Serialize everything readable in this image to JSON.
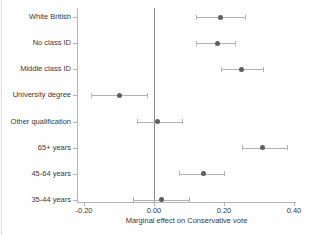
{
  "chart_data": {
    "type": "scatter",
    "subtype": "coefficient-forest-plot",
    "title": "",
    "xlabel": "Marginal effect on Conservative vote",
    "ylabel": "",
    "categories": [
      "White British",
      "No class ID",
      "Middle class ID",
      "University degree",
      "Other qualification",
      "65+ years",
      "45-64 years",
      "35-44 years"
    ],
    "series": [
      {
        "name": "Marginal effect (point estimate with 95% CI)",
        "values": [
          0.19,
          0.18,
          0.25,
          -0.1,
          0.01,
          0.31,
          0.14,
          0.02
        ],
        "ci_low": [
          0.12,
          0.12,
          0.19,
          -0.18,
          -0.05,
          0.25,
          0.07,
          -0.06
        ],
        "ci_high": [
          0.26,
          0.23,
          0.31,
          -0.02,
          0.08,
          0.38,
          0.2,
          0.1
        ]
      }
    ],
    "xlim": [
      -0.22,
      0.41
    ],
    "x_ticks": [
      -0.2,
      0.0,
      0.2,
      0.4
    ],
    "x_tick_labels": [
      "-0.20",
      "0.00",
      "0.20",
      "0.40"
    ],
    "reference_line_x": 0,
    "grid": false,
    "legend": "none",
    "style": {
      "point_color": "#5e5e5e",
      "ci_color": "#b3b3b3",
      "refline_color": "#8a8a8a",
      "axis_color": "#b5b5b5",
      "text_color": "#3a3a3a",
      "background": "#fefefe"
    }
  }
}
